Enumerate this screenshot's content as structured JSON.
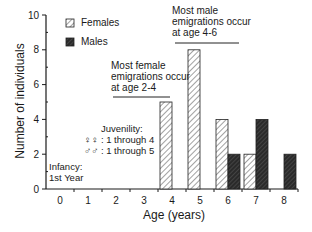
{
  "chart_data": {
    "type": "bar",
    "title": "",
    "xlabel": "Age (years)",
    "ylabel": "Number of individuals",
    "categories": [
      "0",
      "1",
      "2",
      "3",
      "4",
      "5",
      "6",
      "7",
      "8"
    ],
    "series": [
      {
        "name": "Females",
        "pattern": "diagonal-hatch",
        "values": [
          0,
          0,
          0,
          0,
          5,
          8,
          4,
          2,
          0
        ]
      },
      {
        "name": "Males",
        "pattern": "dark-crosshatch",
        "values": [
          0,
          0,
          0,
          0,
          0,
          0,
          2,
          4,
          2
        ]
      }
    ],
    "ylim": [
      0,
      10
    ],
    "yticks": [
      "0",
      "2",
      "4",
      "6",
      "8",
      "10"
    ],
    "grid": false,
    "legend_position": "top-left",
    "annotations": [
      {
        "id": "female",
        "lines": [
          "Most female",
          "emigrations occur",
          "at age 2-4"
        ]
      },
      {
        "id": "male",
        "lines": [
          "Most male",
          "emigrations occur",
          "at age 4-6"
        ]
      },
      {
        "id": "juvenility",
        "lines": [
          "Juvenility:",
          "♀♀ : 1 through 4",
          "♂♂ : 1 through 5"
        ]
      },
      {
        "id": "infancy",
        "lines": [
          "Infancy:",
          "1st Year"
        ]
      }
    ]
  },
  "legend": {
    "females": "Females",
    "males": "Males"
  },
  "colors": {
    "female_fill": "#ffffff",
    "female_hatch": "#333333",
    "male_fill": "#2a2a2a",
    "axis": "#1a1a1a"
  }
}
